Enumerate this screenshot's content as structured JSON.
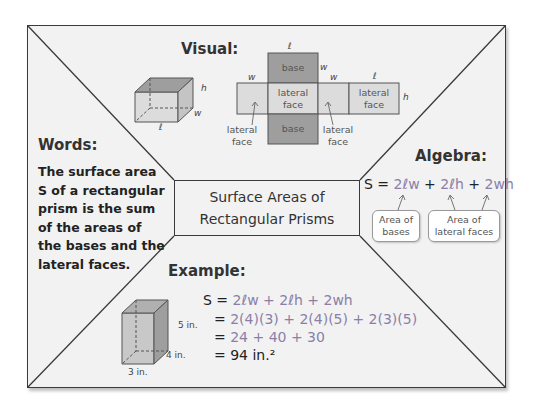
{
  "title": {
    "line1": "Surface Areas of",
    "line2": "Rectangular Prisms"
  },
  "visual": {
    "heading": "Visual:",
    "prism_labels": {
      "h": "h",
      "w": "w",
      "l": "ℓ"
    },
    "net": {
      "top_base": "base",
      "bottom_base": "base",
      "center_face_line1": "lateral",
      "center_face_line2": "face",
      "right_face_line1": "lateral",
      "right_face_line2": "face",
      "left_callout_line1": "lateral",
      "left_callout_line2": "face",
      "right_callout_line1": "lateral",
      "right_callout_line2": "face",
      "dim_l_top": "ℓ",
      "dim_w_left": "w",
      "dim_w_base": "w",
      "dim_w_mid": "w",
      "dim_l_right": "ℓ",
      "dim_h": "h"
    }
  },
  "words": {
    "heading": "Words:",
    "text": "The surface area S of a rectangular prism is the sum of the areas of the bases and the lateral faces."
  },
  "algebra": {
    "heading": "Algebra:",
    "lhs": "S = ",
    "term1": "2ℓw",
    "plus1": " + ",
    "term2": "2ℓh",
    "plus2": " + ",
    "term3": "2wh",
    "callout_bases_line1": "Area of",
    "callout_bases_line2": "bases",
    "callout_lateral_line1": "Area of",
    "callout_lateral_line2": "lateral faces"
  },
  "example": {
    "heading": "Example:",
    "dims": {
      "height": "5 in.",
      "depth": "4 in.",
      "width": "3 in."
    },
    "steps": [
      {
        "prefix": "S = ",
        "expr": "2ℓw + 2ℓh + 2wh"
      },
      {
        "prefix": "= ",
        "expr": "2(4)(3) + 2(4)(5) + 2(3)(5)"
      },
      {
        "prefix": "= ",
        "expr": "24 + 40 + 30"
      },
      {
        "prefix": "= ",
        "expr": "94 in.²"
      }
    ]
  },
  "colors": {
    "frame_bg": "#f2f2f2",
    "line": "#3a3a3a",
    "base_fill": "#9e9e9e",
    "face_fill": "#dcdcdc",
    "accent_text": "#8a7fa8"
  }
}
